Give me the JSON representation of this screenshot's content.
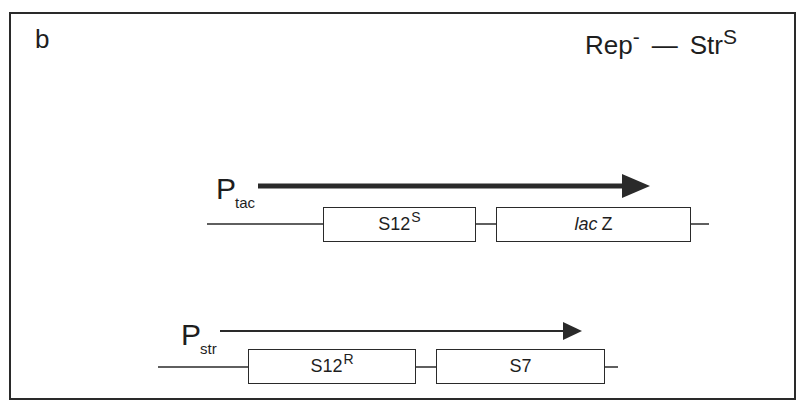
{
  "panel": {
    "label": "b",
    "title": {
      "main_left": "Rep",
      "main_left_sup": "-",
      "dash": "—",
      "main_right": "Str",
      "main_right_sup": "S"
    }
  },
  "constructs": [
    {
      "promoter": {
        "letter": "P",
        "subscript": "tac"
      },
      "transcript_arrow": "thick",
      "genes": [
        {
          "name": "S12",
          "superscript": "S",
          "italic_prefix": ""
        },
        {
          "name": "Z",
          "superscript": "",
          "italic_prefix": "lac"
        }
      ]
    },
    {
      "promoter": {
        "letter": "P",
        "subscript": "str"
      },
      "transcript_arrow": "thin",
      "genes": [
        {
          "name": "S12",
          "superscript": "R",
          "italic_prefix": ""
        },
        {
          "name": "S7",
          "superscript": "",
          "italic_prefix": ""
        }
      ]
    }
  ],
  "colors": {
    "line": "#2a2a2a",
    "background": "#ffffff"
  }
}
